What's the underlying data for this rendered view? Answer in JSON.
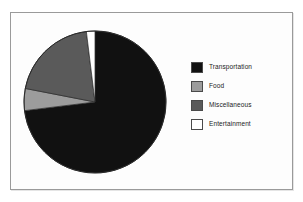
{
  "figure": {
    "background_color": "#fdfdfd",
    "frame_color": "#9a9a9a"
  },
  "legend": {
    "position": "right",
    "entries": [
      {
        "label": "Transportation",
        "color": "#111111",
        "swatch_name": "legend-swatch-transportation"
      },
      {
        "label": "Food",
        "color": "#9c9c9c",
        "swatch_name": "legend-swatch-food"
      },
      {
        "label": "Miscellaneous",
        "color": "#5a5a5a",
        "swatch_name": "legend-swatch-miscellaneous"
      },
      {
        "label": "Entertainment",
        "color": "#ffffff",
        "swatch_name": "legend-swatch-entertainment"
      }
    ]
  },
  "chart_data": {
    "type": "pie",
    "title": "",
    "subtitle": "",
    "xlabel": "",
    "ylabel": "",
    "grid": false,
    "legend_position": "right",
    "start_angle_deg": 0,
    "direction": "clockwise",
    "categories": [
      "Transportation",
      "Food",
      "Miscellaneous",
      "Entertainment"
    ],
    "values": [
      73,
      5,
      20,
      2
    ],
    "value_unit": "percent",
    "colors": [
      "#111111",
      "#9c9c9c",
      "#5a5a5a",
      "#ffffff"
    ],
    "slices": [
      {
        "label": "Transportation",
        "value": 73,
        "color": "#111111",
        "start_angle_deg": 0,
        "end_angle_deg": 263
      },
      {
        "label": "Food",
        "value": 5,
        "color": "#9c9c9c",
        "start_angle_deg": 263,
        "end_angle_deg": 281
      },
      {
        "label": "Miscellaneous",
        "value": 20,
        "color": "#5a5a5a",
        "start_angle_deg": 281,
        "end_angle_deg": 353
      },
      {
        "label": "Entertainment",
        "value": 2,
        "color": "#ffffff",
        "start_angle_deg": 353,
        "end_angle_deg": 360
      }
    ]
  }
}
